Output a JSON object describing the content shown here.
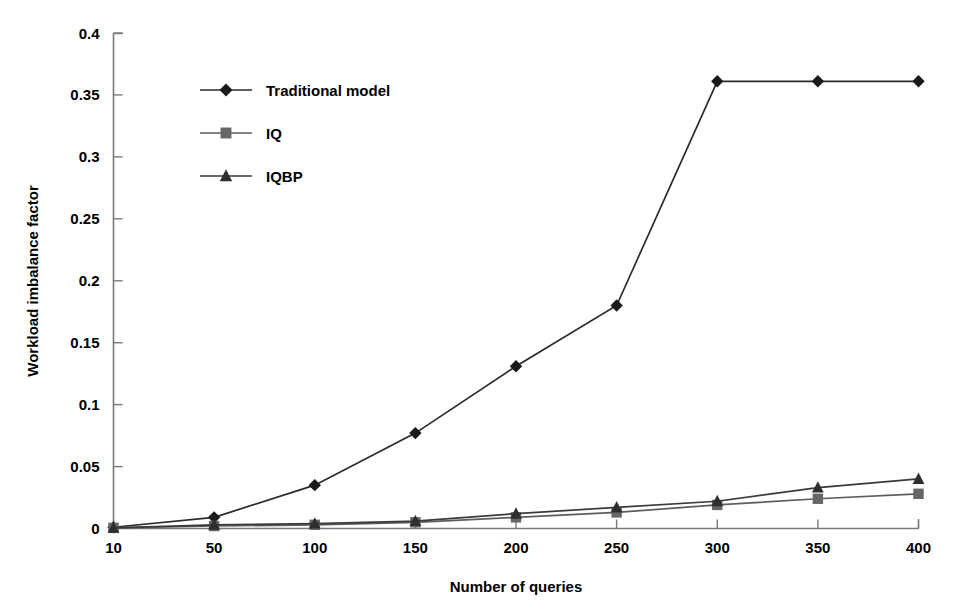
{
  "chart_data": {
    "type": "line",
    "title": "",
    "xlabel": "Number of queries",
    "ylabel": "Workload imbalance factor",
    "x": [
      10,
      50,
      100,
      150,
      200,
      250,
      300,
      350,
      400
    ],
    "xtick_labels": [
      "10",
      "50",
      "100",
      "150",
      "200",
      "250",
      "300",
      "350",
      "400"
    ],
    "ytick_labels": [
      "0",
      "0.05",
      "0.1",
      "0.15",
      "0.2",
      "0.25",
      "0.3",
      "0.35",
      "0.4"
    ],
    "ytick_values": [
      0,
      0.05,
      0.1,
      0.15,
      0.2,
      0.25,
      0.3,
      0.35,
      0.4
    ],
    "ylim": [
      0,
      0.4
    ],
    "grid": false,
    "legend_position": "upper-left-inside",
    "series": [
      {
        "name": "Traditional model",
        "marker": "diamond",
        "color": "#1a1a1a",
        "values": [
          0.001,
          0.009,
          0.035,
          0.077,
          0.131,
          0.18,
          0.361,
          0.361,
          0.361
        ]
      },
      {
        "name": "IQ",
        "marker": "square",
        "color": "#666666",
        "values": [
          0.0005,
          0.002,
          0.003,
          0.005,
          0.009,
          0.013,
          0.019,
          0.024,
          0.028
        ]
      },
      {
        "name": "IQBP",
        "marker": "triangle",
        "color": "#2e2e2e",
        "values": [
          0.0005,
          0.003,
          0.004,
          0.006,
          0.012,
          0.017,
          0.022,
          0.033,
          0.04
        ]
      }
    ]
  },
  "legend": {
    "items": [
      {
        "label": "Traditional model",
        "marker": "diamond-marker-icon"
      },
      {
        "label": "IQ",
        "marker": "square-marker-icon"
      },
      {
        "label": "IQBP",
        "marker": "triangle-marker-icon"
      }
    ]
  },
  "axes": {
    "x_title": "Number of queries",
    "y_title": "Workload imbalance factor"
  }
}
